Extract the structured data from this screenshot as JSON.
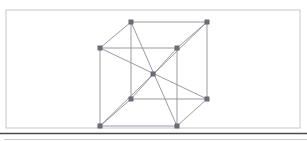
{
  "figure": {
    "kind": "wireframe-cube-diagram",
    "canvas": {
      "width": 307,
      "height": 141,
      "background": "#ffffff"
    },
    "colors": {
      "frame_stroke": "#c8c8cc",
      "edge_stroke": "#8e8e98",
      "diagonal_stroke": "#8e8e98",
      "vertex_fill": "#6f6f78",
      "vertex_stroke": "#5a5a64",
      "baseline_rule": "#4a4a50",
      "lower_rule": "#c8c8cc"
    },
    "frame": {
      "x": 6,
      "y": 10,
      "width": 294,
      "height": 118,
      "stroke_width": 1
    },
    "baseline_rule": {
      "x1": 0,
      "y1": 133.5,
      "x2": 307,
      "y2": 133.5,
      "stroke_width": 1.6
    },
    "lower_rule": {
      "x1": 4,
      "y1": 139.5,
      "x2": 307,
      "y2": 139.5,
      "stroke_width": 1
    },
    "vertices": [
      {
        "id": "back-top-left",
        "name": "vertex-back-top-left",
        "x": 131,
        "y": 22
      },
      {
        "id": "back-top-right",
        "name": "vertex-back-top-right",
        "x": 207,
        "y": 22
      },
      {
        "id": "front-top-left",
        "name": "vertex-front-top-left",
        "x": 100,
        "y": 48
      },
      {
        "id": "front-top-right",
        "name": "vertex-front-top-right",
        "x": 177,
        "y": 48
      },
      {
        "id": "body-center",
        "name": "vertex-body-center",
        "x": 153,
        "y": 74
      },
      {
        "id": "back-bottom-left",
        "name": "vertex-back-bottom-left",
        "x": 131,
        "y": 99
      },
      {
        "id": "back-bottom-right",
        "name": "vertex-back-bottom-right",
        "x": 207,
        "y": 99
      },
      {
        "id": "front-bottom-left",
        "name": "vertex-front-bottom-left",
        "x": 100,
        "y": 126
      },
      {
        "id": "front-bottom-right",
        "name": "vertex-front-bottom-right",
        "x": 177,
        "y": 126
      }
    ],
    "vertex_size": 4.2,
    "edges": [
      {
        "name": "edge-back-top",
        "from": "back-top-left",
        "to": "back-top-right"
      },
      {
        "name": "edge-front-top",
        "from": "front-top-left",
        "to": "front-top-right"
      },
      {
        "name": "edge-back-bottom",
        "from": "back-bottom-left",
        "to": "back-bottom-right"
      },
      {
        "name": "edge-front-bottom",
        "from": "front-bottom-left",
        "to": "front-bottom-right"
      },
      {
        "name": "edge-left-back-vertical",
        "from": "back-top-left",
        "to": "back-bottom-left"
      },
      {
        "name": "edge-right-back-vertical",
        "from": "back-top-right",
        "to": "back-bottom-right"
      },
      {
        "name": "edge-left-front-vertical",
        "from": "front-top-left",
        "to": "front-bottom-left"
      },
      {
        "name": "edge-right-front-vertical",
        "from": "front-top-right",
        "to": "front-bottom-right"
      },
      {
        "name": "edge-top-left-depth",
        "from": "front-top-left",
        "to": "back-top-left"
      },
      {
        "name": "edge-top-right-depth",
        "from": "front-top-right",
        "to": "back-top-right"
      },
      {
        "name": "edge-bottom-left-depth",
        "from": "front-bottom-left",
        "to": "back-bottom-left"
      },
      {
        "name": "edge-bottom-right-depth",
        "from": "front-bottom-right",
        "to": "back-bottom-right"
      }
    ],
    "diagonals": [
      {
        "name": "diagonal-back-top-left-to-front-bottom-right",
        "from": "back-top-left",
        "to": "front-bottom-right"
      },
      {
        "name": "diagonal-back-top-right-to-front-bottom-left",
        "from": "back-top-right",
        "to": "front-bottom-left"
      },
      {
        "name": "diagonal-front-top-left-to-back-bottom-right",
        "from": "front-top-left",
        "to": "back-bottom-right"
      },
      {
        "name": "diagonal-front-top-right-to-back-bottom-left",
        "from": "front-top-right",
        "to": "back-bottom-left"
      }
    ]
  }
}
